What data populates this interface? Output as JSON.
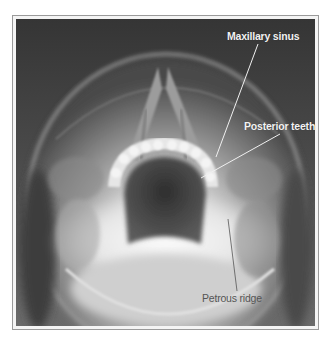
{
  "figure": {
    "labels": [
      {
        "id": "maxillary-sinus",
        "text": "Maxillary sinus",
        "x": 227,
        "y": 30,
        "style": "light",
        "leader": {
          "x1": 258,
          "y1": 44,
          "x2": 216,
          "y2": 157
        }
      },
      {
        "id": "posterior-teeth",
        "text": "Posterior teeth",
        "x": 244,
        "y": 120,
        "style": "light",
        "leader": {
          "x1": 280,
          "y1": 134,
          "x2": 201,
          "y2": 178
        }
      },
      {
        "id": "petrous-ridge",
        "text": "Petrous ridge",
        "x": 202,
        "y": 292,
        "style": "dark",
        "leader": {
          "x1": 228,
          "y1": 219,
          "x2": 237,
          "y2": 291
        }
      }
    ],
    "colors": {
      "background": "#ffffff",
      "frame_border": "#9a9a9a",
      "film_dark": "#3a3a3a",
      "bone_light": "#eeeeee",
      "light_label": "#f2f2f2",
      "dark_label": "#555555",
      "leader_light": "#f0f0f0",
      "leader_dark": "#555555"
    }
  }
}
